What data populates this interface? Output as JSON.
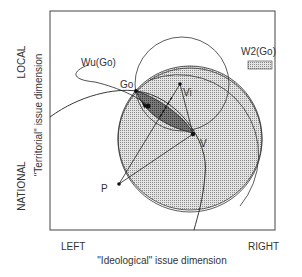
{
  "diagram": {
    "legend": {
      "label": "W2(Go)"
    },
    "y_axis": {
      "top_label": "LOCAL",
      "bottom_label": "NATIONAL",
      "title": "\"Territorial\" issue dimension"
    },
    "x_axis": {
      "left_label": "LEFT",
      "right_label": "RIGHT",
      "title": "\"Ideological\" issue dimension"
    },
    "points": {
      "go": "Go",
      "vi": "Vi",
      "v": "V",
      "p": "P"
    },
    "curve_label": "Wu(Go)",
    "colors": {
      "frame": "#333333",
      "shade_light": "#c8c8c8",
      "shade_dark": "#6e6e6e",
      "line": "#222222"
    }
  }
}
